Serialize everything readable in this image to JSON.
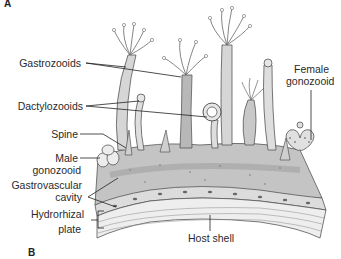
{
  "figure": {
    "panel_a": "A",
    "panel_b": "B",
    "labels": {
      "gastrozooids": "Gastrozooids",
      "dactylozooids": "Dactylozooids",
      "spine": "Spine",
      "male_gonozooid_1": "Male",
      "male_gonozooid_2": "gonozooid",
      "gastrovascular_1": "Gastrovascular",
      "gastrovascular_2": "cavity",
      "hydrorhizal_1": "Hydrorhizal",
      "hydrorhizal_2": "plate",
      "host_shell": "Host shell",
      "female_gonozooid_1": "Female",
      "female_gonozooid_2": "gonozooid"
    },
    "colors": {
      "ink": "#2a2a2a",
      "tissue": "#b9b9b9",
      "tissue_dark": "#8f8f8f",
      "shell": "#e4e4e4"
    }
  }
}
